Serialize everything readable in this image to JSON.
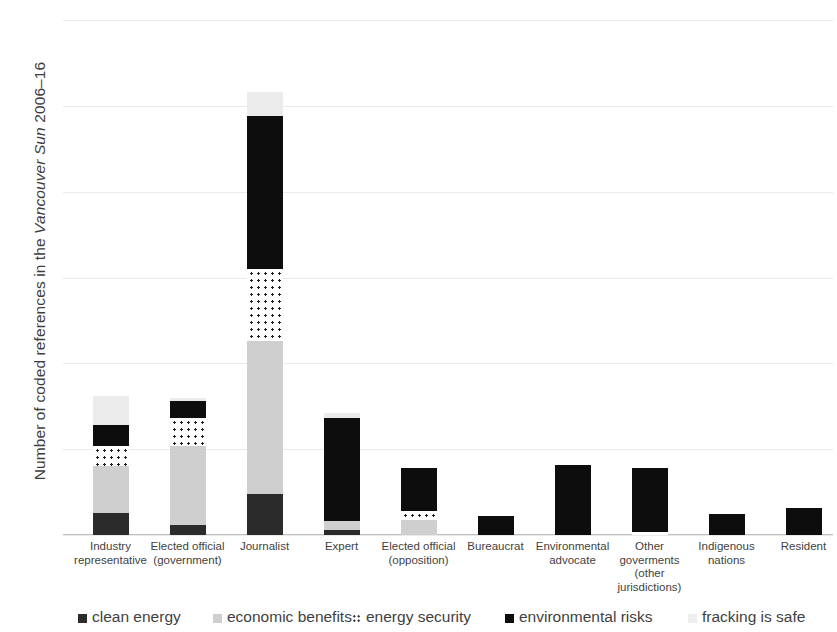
{
  "chart_data": {
    "type": "bar",
    "subtype": "stacked-column",
    "title": "",
    "xlabel": "",
    "ylabel": "Number of coded references in the Vancouver Sun 2006–16",
    "ylabel_parts": {
      "prefix": "Number of coded references in the ",
      "italic": "Vancouver Sun",
      "suffix": " 2006–16"
    },
    "ylim": [
      0,
      300
    ],
    "yticks": [
      0,
      50,
      100,
      150,
      200,
      250,
      300
    ],
    "ytick_labels": [
      "0",
      "50",
      "100",
      "150",
      "200",
      "250",
      "300"
    ],
    "grid": true,
    "legend_position": "bottom",
    "categories": [
      "Industry representative",
      "Elected official (government)",
      "Journalist",
      "Expert",
      "Elected official (opposition)",
      "Bureaucrat",
      "Environmental advocate",
      "Other goverments (other jurisdictions)",
      "Indigenous nations",
      "Resident"
    ],
    "category_lines": [
      [
        "Industry",
        "representative"
      ],
      [
        "Elected official",
        "(government)"
      ],
      [
        "Journalist"
      ],
      [
        "Expert"
      ],
      [
        "Elected official",
        "(opposition)"
      ],
      [
        "Bureaucrat"
      ],
      [
        "Environmental",
        "advocate"
      ],
      [
        "Other",
        "goverments",
        "(other",
        "jurisdictions)"
      ],
      [
        "Indigenous",
        "nations"
      ],
      [
        "Resident"
      ]
    ],
    "series": [
      {
        "name": "clean energy",
        "key": "clean",
        "color": "#2b2b2b",
        "values": [
          13,
          6,
          24,
          3,
          0,
          0,
          0,
          0,
          0,
          0
        ]
      },
      {
        "name": "economic benefits",
        "key": "econ",
        "color": "#cfcfcf",
        "values": [
          27,
          46,
          89,
          5,
          9,
          0,
          0,
          0,
          0,
          0
        ]
      },
      {
        "name": "energy security",
        "key": "sec",
        "color": "#ffffff",
        "values": [
          12,
          16,
          42,
          0,
          5,
          0,
          0,
          2,
          0,
          0
        ]
      },
      {
        "name": "environmental risks",
        "key": "env",
        "color": "#0d0d0d",
        "values": [
          12,
          10,
          89,
          60,
          25,
          11,
          41,
          37,
          12,
          16
        ]
      },
      {
        "name": "fracking is safe",
        "key": "frack",
        "color": "#ebebeb",
        "values": [
          17,
          2,
          14,
          3,
          0,
          0,
          0,
          0,
          0,
          0
        ]
      }
    ],
    "totals": [
      81,
      80,
      258,
      71,
      39,
      11,
      41,
      39,
      12,
      16
    ]
  },
  "legend": {
    "items": [
      {
        "label": "clean energy",
        "swatch": "clean"
      },
      {
        "label": "economic benefits",
        "swatch": "econ"
      },
      {
        "label": "energy security",
        "swatch": "sec"
      },
      {
        "label": "environmental risks",
        "swatch": "env"
      },
      {
        "label": "fracking is safe",
        "swatch": "frack"
      }
    ]
  }
}
